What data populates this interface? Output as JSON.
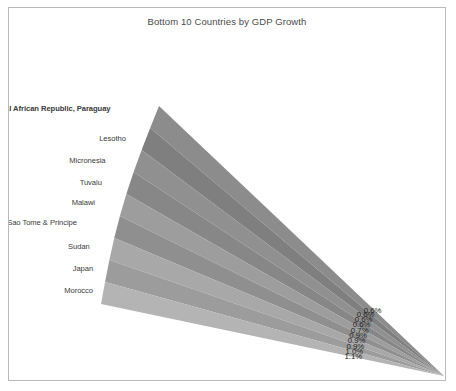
{
  "chart": {
    "title": "Bottom 10 Countries by GDP Growth"
  },
  "chart_data": {
    "type": "area",
    "title": "Bottom 10 Countries by GDP Growth",
    "xlabel": "",
    "ylabel": "",
    "legend_position": "none",
    "grid": false,
    "categories": [
      "Central African Republic, Paraguay",
      "Lesotho",
      "Micronesia",
      "Tuvalu",
      "Malawi",
      "Sao Tome & Principe",
      "Sudan",
      "Japan",
      "Morocco"
    ],
    "values": [
      0.6,
      0.6,
      0.6,
      0.7,
      0.9,
      0.9,
      0.9,
      1.0,
      1.1
    ],
    "value_labels": [
      "0.6%",
      "0.6%",
      "0.6%",
      "0.7%",
      "0.9%",
      "0.9%",
      "0.9%",
      "1.0%",
      "1.1%"
    ],
    "overlapping_top_labels": [
      "0.6%",
      "0.6%"
    ],
    "band_colors": [
      "#8c8c8c",
      "#7f7f7f",
      "#909090",
      "#878787",
      "#9d9d9d",
      "#8f8f8f",
      "#a8a8a8",
      "#9c9c9c",
      "#b4b4b4"
    ]
  },
  "bands": [
    {
      "label": "Central African Republic, Paraguay",
      "value_label": "0.6%",
      "color": "#8c8c8c",
      "bold": true
    },
    {
      "label": "Lesotho",
      "value_label": "0.6%",
      "color": "#7f7f7f",
      "bold": false
    },
    {
      "label": "Micronesia",
      "value_label": "0.6%",
      "color": "#909090",
      "bold": false
    },
    {
      "label": "Tuvalu",
      "value_label": "0.7%",
      "color": "#878787",
      "bold": false
    },
    {
      "label": "Malawi",
      "value_label": "0.9%",
      "color": "#9d9d9d",
      "bold": false
    },
    {
      "label": "Sao Tome & Principe",
      "value_label": "0.9%",
      "color": "#8f8f8f",
      "bold": false
    },
    {
      "label": "Sudan",
      "value_label": "0.9%",
      "color": "#a8a8a8",
      "bold": false
    },
    {
      "label": "Japan",
      "value_label": "1.0%",
      "color": "#9c9c9c",
      "bold": false
    },
    {
      "label": "Morocco",
      "value_label": "1.1%",
      "color": "#b4b4b4",
      "bold": false
    }
  ],
  "colors": {
    "frame_border": "#b9b9b9",
    "title_text": "#4a4a4a",
    "label_text": "#3a3a3a",
    "value_text": "#232323",
    "background": "#ffffff"
  }
}
